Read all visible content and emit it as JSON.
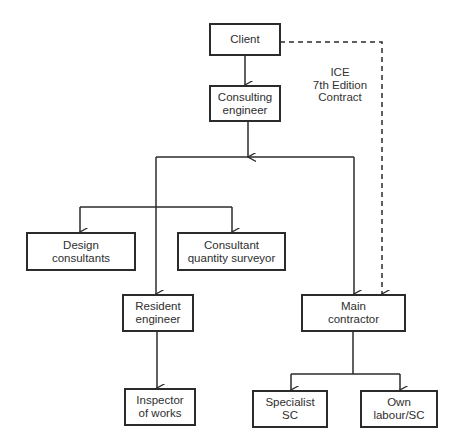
{
  "diagram": {
    "type": "organization-chart",
    "nodes": {
      "client": {
        "lines": [
          "Client"
        ]
      },
      "consulting_engineer": {
        "lines": [
          "Consulting",
          "engineer"
        ]
      },
      "design_consultants": {
        "lines": [
          "Design",
          "consultants"
        ]
      },
      "consultant_qs": {
        "lines": [
          "Consultant",
          "quantity surveyor"
        ]
      },
      "resident_engineer": {
        "lines": [
          "Resident",
          "engineer"
        ]
      },
      "main_contractor": {
        "lines": [
          "Main",
          "contractor"
        ]
      },
      "inspector_of_works": {
        "lines": [
          "Inspector",
          "of works"
        ]
      },
      "specialist_sc": {
        "lines": [
          "Specialist",
          "SC"
        ]
      },
      "own_labour_sc": {
        "lines": [
          "Own",
          "labour/SC"
        ]
      }
    },
    "contract_label": {
      "lines": [
        "ICE",
        "7th Edition",
        "Contract"
      ]
    },
    "edges": [
      {
        "from": "Client",
        "to": "Consulting engineer",
        "style": "solid"
      },
      {
        "from": "Consulting engineer",
        "to": "Design consultants",
        "style": "solid"
      },
      {
        "from": "Consulting engineer",
        "to": "Consultant quantity surveyor",
        "style": "solid"
      },
      {
        "from": "Consulting engineer",
        "to": "Resident engineer",
        "style": "solid"
      },
      {
        "from": "Consulting engineer",
        "to": "Main contractor",
        "style": "solid"
      },
      {
        "from": "Client",
        "to": "Main contractor",
        "style": "dashed",
        "label": "ICE 7th Edition Contract"
      },
      {
        "from": "Resident engineer",
        "to": "Inspector of works",
        "style": "solid"
      },
      {
        "from": "Main contractor",
        "to": "Specialist SC",
        "style": "solid"
      },
      {
        "from": "Main contractor",
        "to": "Own labour/SC",
        "style": "solid"
      }
    ],
    "colors": {
      "line": "#2b2b2b",
      "text": "#2e2e2e",
      "background": "#ffffff"
    }
  }
}
